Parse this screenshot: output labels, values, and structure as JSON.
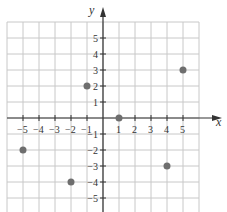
{
  "chart_data": {
    "type": "scatter",
    "title": "",
    "xlabel": "x",
    "ylabel": "y",
    "xlim": [
      -6,
      6
    ],
    "ylim": [
      -6,
      6
    ],
    "grid": true,
    "x_ticks": [
      -5,
      -4,
      -3,
      -2,
      -1,
      1,
      2,
      3,
      4,
      5
    ],
    "y_ticks": [
      5,
      4,
      3,
      2,
      1,
      -1,
      -2,
      -3,
      -4,
      -5
    ],
    "x_tick_labels": [
      "−5",
      "−4",
      "−3",
      "−2",
      "−1",
      "1",
      "2",
      "3",
      "4",
      "5"
    ],
    "y_tick_labels": [
      "5",
      "4",
      "3",
      "2",
      "1",
      "−1",
      "−2",
      "−3",
      "−4",
      "−5"
    ],
    "points": [
      {
        "x": -1,
        "y": 2
      },
      {
        "x": 5,
        "y": 3
      },
      {
        "x": 1,
        "y": 0
      },
      {
        "x": -5,
        "y": -2
      },
      {
        "x": -2,
        "y": -4
      },
      {
        "x": 4,
        "y": -3
      }
    ],
    "colors": {
      "grid": "#c8c8c8",
      "axis": "#333333",
      "point": "#6e6e6e"
    }
  }
}
